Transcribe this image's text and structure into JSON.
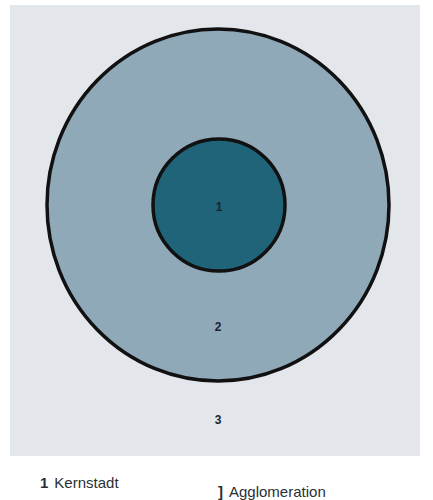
{
  "diagram": {
    "type": "concentric-zones",
    "colors": {
      "background_zone": "#e3e6ea",
      "outer_zone": "#8fa9b8",
      "inner_zone": "#1f6479",
      "stroke": "#111111"
    },
    "zones": [
      {
        "number": "1",
        "name": "Kernstadt"
      },
      {
        "number": "2",
        "name": ""
      },
      {
        "number": "3",
        "name": ""
      }
    ]
  },
  "legend": [
    {
      "number": "1",
      "label": "Kernstadt"
    },
    {
      "number": "]",
      "label": "Agglomeration"
    }
  ]
}
